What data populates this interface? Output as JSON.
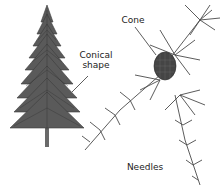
{
  "diagram": {
    "labels": {
      "tree_shape": "Conical\nshape",
      "cone": "Cone",
      "needles": "Needles"
    },
    "colors": {
      "ink": "#3a3a3a",
      "foliage": "#555555",
      "cone": "#444444",
      "background": "#ffffff"
    }
  }
}
